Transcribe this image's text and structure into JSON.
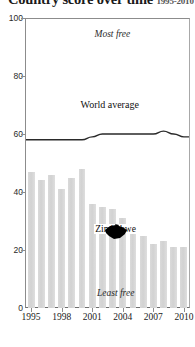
{
  "title": {
    "text": "Country score over time",
    "years": "1995-2010"
  },
  "chart_data": {
    "type": "bar",
    "title": "Country score over time",
    "xlabel": "",
    "ylabel": "",
    "ylim": [
      0,
      100
    ],
    "yticks": [
      0,
      20,
      40,
      60,
      80,
      100
    ],
    "xticks": [
      "1995",
      "1998",
      "2001",
      "2004",
      "2007",
      "2010"
    ],
    "grid": false,
    "legend": "none",
    "categories": [
      "1995",
      "1996",
      "1997",
      "1998",
      "1999",
      "2000",
      "2001",
      "2002",
      "2003",
      "2004",
      "2005",
      "2006",
      "2007",
      "2008",
      "2009",
      "2010"
    ],
    "series": [
      {
        "name": "Zimbabwe",
        "type": "bar",
        "color": "#d8d8d8",
        "values": [
          47,
          44,
          46,
          41,
          45,
          48,
          36,
          35,
          34,
          31,
          28,
          25,
          22,
          23,
          21,
          21
        ]
      },
      {
        "name": "World average",
        "type": "line",
        "color": "#2a2a2a",
        "values": [
          58,
          58,
          58,
          58,
          58,
          58,
          59,
          60,
          60,
          60,
          60,
          60,
          60,
          61,
          60,
          59
        ]
      }
    ],
    "annotations": [
      {
        "name": "most-free",
        "text": "Most free",
        "x": "2002",
        "y": 94
      },
      {
        "name": "least-free",
        "text": "Least free",
        "x": "2003",
        "y": 4
      },
      {
        "name": "world-average",
        "text": "World average",
        "x": "2002",
        "y": 70
      },
      {
        "name": "zimbabwe",
        "text": "Zimbabwe",
        "x": "2004",
        "y": 27
      }
    ]
  },
  "axis": {
    "y_labels": [
      "100",
      "80",
      "60",
      "40",
      "20",
      "0"
    ],
    "x_labels": [
      "1995",
      "1998",
      "2001",
      "2004",
      "2007",
      "2010"
    ]
  },
  "labels": {
    "most_free": "Most free",
    "least_free": "Least free",
    "world_average": "World average",
    "zimbabwe": "Zimbabwe"
  },
  "colors": {
    "bar": "#d8d8d8",
    "line": "#2a2a2a",
    "axis": "#8c8c8c",
    "text": "#1a1a1a",
    "map": "#000000"
  }
}
